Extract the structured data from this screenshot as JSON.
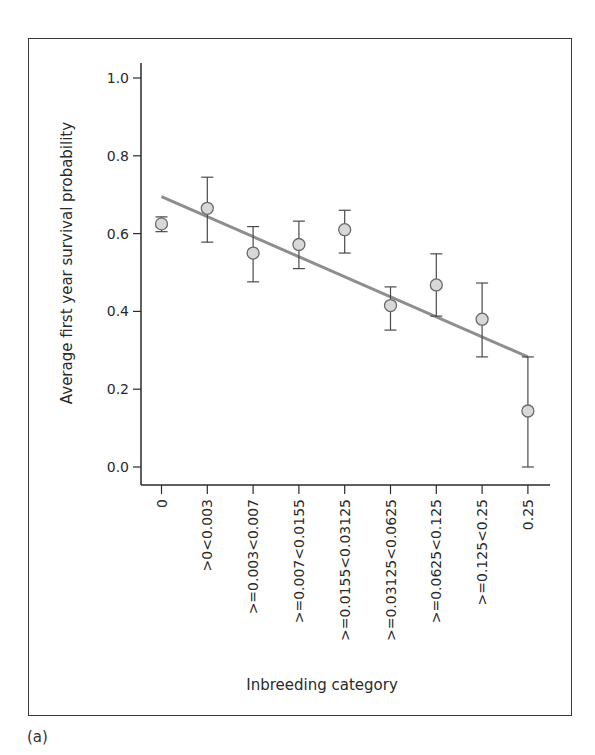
{
  "panel_label": "(a)",
  "chart_data": {
    "type": "scatter",
    "title": "",
    "xlabel": "Inbreeding category",
    "ylabel": "Average first year survival probability",
    "ylim": [
      0.0,
      1.0
    ],
    "yticks": [
      "0.0",
      "0.2",
      "0.4",
      "0.6",
      "0.8",
      "1.0"
    ],
    "ytick_values": [
      0.0,
      0.2,
      0.4,
      0.6,
      0.8,
      1.0
    ],
    "grid": false,
    "categories": [
      "0",
      ">0<0.003",
      ">=0.003<0.007",
      ">=0.007<0.0155",
      ">=0.0155<0.03125",
      ">=0.03125<0.0625",
      ">=0.0625<0.125",
      ">=0.125<0.25",
      "0.25"
    ],
    "series": [
      {
        "name": "Mean survival",
        "marker": "circle",
        "values": [
          0.625,
          0.665,
          0.55,
          0.572,
          0.61,
          0.415,
          0.468,
          0.38,
          0.144
        ],
        "error_low": [
          0.605,
          0.578,
          0.476,
          0.51,
          0.55,
          0.352,
          0.388,
          0.283,
          0.0
        ],
        "error_high": [
          0.643,
          0.745,
          0.618,
          0.632,
          0.66,
          0.463,
          0.548,
          0.473,
          0.283
        ]
      }
    ],
    "trend_line": {
      "name": "Linear fit",
      "start": {
        "category_index": 0,
        "y": 0.695
      },
      "end": {
        "category_index": 8,
        "y": 0.283
      }
    },
    "colors": {
      "marker_fill": "#d8d8d8",
      "marker_stroke": "#6a6a6a",
      "error_bar": "#4a4a4a",
      "trend_line": "#8e8e8e",
      "axis": "#2a2a2a"
    }
  }
}
